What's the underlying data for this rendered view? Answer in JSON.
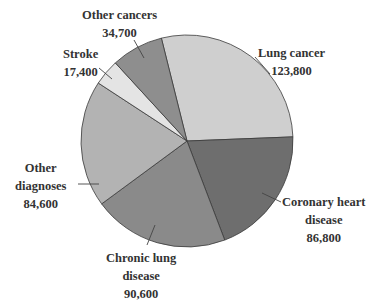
{
  "chart_data": {
    "type": "pie",
    "title": "",
    "total": 437900,
    "slices": [
      {
        "label": "Lung cancer",
        "value": 123800,
        "color": "#cfcfcf"
      },
      {
        "label": "Coronary heart disease",
        "value": 86800,
        "color": "#6e6e6e"
      },
      {
        "label": "Chronic lung disease",
        "value": 90600,
        "color": "#8a8a8a"
      },
      {
        "label": "Other diagnoses",
        "value": 84600,
        "color": "#b3b3b3"
      },
      {
        "label": "Stroke",
        "value": 17400,
        "color": "#e4e4e4"
      },
      {
        "label": "Other cancers",
        "value": 34700,
        "color": "#8e8e8e"
      }
    ],
    "start_angle_deg": -14,
    "direction": "clockwise"
  },
  "labels": {
    "lung": {
      "name": "Lung cancer",
      "value": "123,800"
    },
    "coronary": {
      "name1": "Coronary heart",
      "name2": "disease",
      "value": "86,800"
    },
    "chronic": {
      "name1": "Chronic lung",
      "name2": "disease",
      "value": "90,600"
    },
    "other_dx": {
      "name1": "Other",
      "name2": "diagnoses",
      "value": "84,600"
    },
    "stroke": {
      "name": "Stroke",
      "value": "17,400"
    },
    "other_cancers": {
      "name": "Other cancers",
      "value": "34,700"
    }
  }
}
